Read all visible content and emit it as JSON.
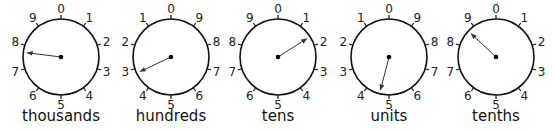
{
  "dials": [
    {
      "label": "thousands",
      "cx": 61,
      "direction": "clockwise",
      "pointer_value": 7.7,
      "numbers": [
        "0",
        "1",
        "2",
        "3",
        "4",
        "5",
        "6",
        "7",
        "8",
        "9"
      ]
    },
    {
      "label": "hundreds",
      "cx": 171,
      "direction": "anticlockwise",
      "pointer_value": 3.2,
      "numbers": [
        "0",
        "1",
        "2",
        "3",
        "4",
        "5",
        "6",
        "7",
        "8",
        "9"
      ]
    },
    {
      "label": "tens",
      "cx": 278,
      "direction": "clockwise",
      "pointer_value": 1.6,
      "numbers": [
        "0",
        "1",
        "2",
        "3",
        "4",
        "5",
        "6",
        "7",
        "8",
        "9"
      ]
    },
    {
      "label": "units",
      "cx": 389,
      "direction": "anticlockwise",
      "pointer_value": 4.6,
      "numbers": [
        "0",
        "1",
        "2",
        "3",
        "4",
        "5",
        "6",
        "7",
        "8",
        "9"
      ]
    },
    {
      "label": "tenths",
      "cx": 496,
      "direction": "clockwise",
      "pointer_value": 8.7,
      "numbers": [
        "0",
        "1",
        "2",
        "3",
        "4",
        "5",
        "6",
        "7",
        "8",
        "9"
      ]
    }
  ],
  "colors": {
    "stroke": "#111111",
    "pointer": "#333333"
  }
}
